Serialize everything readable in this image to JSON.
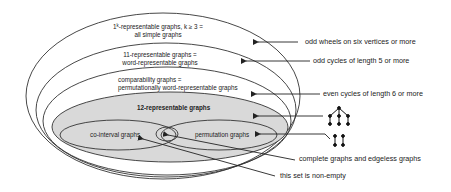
{
  "diagram": {
    "type": "nested-set-euler-diagram",
    "colors": {
      "stroke": "#333333",
      "gray_fill": "#d9d9d9",
      "background": "#ffffff"
    },
    "sets": [
      {
        "id": "all",
        "line1_pre": "1",
        "line1_sup": "k",
        "line1_post": "-representable graphs, k ≥ 3 =",
        "line2": "all simple graphs"
      },
      {
        "id": "word",
        "line1": "11-representable graphs =",
        "line2": "word-representable graphs"
      },
      {
        "id": "comparability",
        "line1": "comparability graphs =",
        "line2": "permutationally word-representable graphs"
      },
      {
        "id": "12rep",
        "line1": "12-representable graphs"
      },
      {
        "id": "cointerval",
        "line1": "co-interval graphs"
      },
      {
        "id": "permutation",
        "line1": "permutation graphs"
      }
    ],
    "annotations": [
      {
        "id": "odd-wheels",
        "text": "odd wheels on six vertices or more"
      },
      {
        "id": "odd-cycles",
        "text": "odd cycles of length 5 or more"
      },
      {
        "id": "even-cycles",
        "text": "even cycles of length 6 or more"
      },
      {
        "id": "tree-example",
        "icon": "tree-graph-icon"
      },
      {
        "id": "two-edges-example",
        "icon": "two-disjoint-edges-icon"
      },
      {
        "id": "complete-edgeless",
        "text": "complete graphs and edgeless graphs"
      },
      {
        "id": "non-empty",
        "text": "this set is non-empty"
      }
    ]
  }
}
